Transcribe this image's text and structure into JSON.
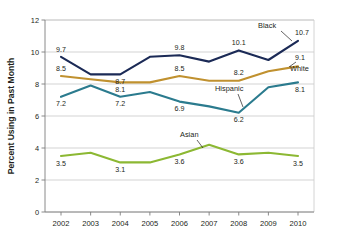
{
  "chart_data": {
    "type": "line",
    "title": "",
    "subtitle": "",
    "xlabel": "",
    "ylabel": "Percent Using in Past Month",
    "categories": [
      "2002",
      "2003",
      "2004",
      "2005",
      "2006",
      "2007",
      "2008",
      "2009",
      "2010"
    ],
    "x": [
      2002,
      2003,
      2004,
      2005,
      2006,
      2007,
      2008,
      2009,
      2010
    ],
    "ylim": [
      0,
      12
    ],
    "yticks": [
      0,
      2,
      4,
      6,
      8,
      10,
      12
    ],
    "grid": "horizontal",
    "legend_position": "inline-labels",
    "series": [
      {
        "name": "Black",
        "color": "#1b2a56",
        "values": [
          9.7,
          8.6,
          8.6,
          9.7,
          9.8,
          9.4,
          10.1,
          9.5,
          10.7
        ],
        "point_labels": [
          {
            "x": "2002",
            "value": "9.7"
          },
          {
            "x": "2004",
            "value": "8.7"
          },
          {
            "x": "2006",
            "value": "9.8"
          },
          {
            "x": "2008",
            "value": "10.1"
          },
          {
            "x": "2010",
            "value": "10.7"
          }
        ]
      },
      {
        "name": "White",
        "color": "#c0912f",
        "values": [
          8.5,
          8.3,
          8.1,
          8.1,
          8.5,
          8.2,
          8.2,
          8.8,
          9.1
        ],
        "point_labels": [
          {
            "x": "2002",
            "value": "8.5"
          },
          {
            "x": "2004",
            "value": "8.1"
          },
          {
            "x": "2006",
            "value": "8.5"
          },
          {
            "x": "2008",
            "value": "8.2"
          },
          {
            "x": "2010",
            "value": "9.1"
          }
        ]
      },
      {
        "name": "Hispanic",
        "color": "#2b7b8e",
        "values": [
          7.2,
          7.9,
          7.2,
          7.5,
          6.9,
          6.6,
          6.2,
          7.8,
          8.1
        ],
        "point_labels": [
          {
            "x": "2002",
            "value": "7.2"
          },
          {
            "x": "2004",
            "value": "7.2"
          },
          {
            "x": "2006",
            "value": "6.9"
          },
          {
            "x": "2008",
            "value": "6.2"
          },
          {
            "x": "2010",
            "value": "8.1"
          }
        ]
      },
      {
        "name": "Asian",
        "color": "#8cb833",
        "values": [
          3.5,
          3.7,
          3.1,
          3.1,
          3.6,
          4.2,
          3.6,
          3.7,
          3.5
        ],
        "point_labels": [
          {
            "x": "2002",
            "value": "3.5"
          },
          {
            "x": "2004",
            "value": "3.1"
          },
          {
            "x": "2006",
            "value": "3.6"
          },
          {
            "x": "2008",
            "value": "3.6"
          },
          {
            "x": "2010",
            "value": "3.5"
          }
        ]
      }
    ],
    "annotations": [
      {
        "label": "Black",
        "series": "Black"
      },
      {
        "label": "White",
        "series": "White"
      },
      {
        "label": "Hispanic",
        "series": "Hispanic"
      },
      {
        "label": "Asian",
        "series": "Asian"
      }
    ]
  },
  "axis": {
    "y_label": "Percent Using in Past Month",
    "y_ticks": [
      "12",
      "10",
      "8",
      "6",
      "4",
      "2",
      "0"
    ],
    "x_ticks": [
      "2002",
      "2003",
      "2004",
      "2005",
      "2006",
      "2007",
      "2008",
      "2009",
      "2010"
    ]
  },
  "labels": {
    "black": "Black",
    "white": "White",
    "hispanic": "Hispanic",
    "asian": "Asian",
    "black_pts": [
      "9.7",
      "8.7",
      "9.8",
      "10.1",
      "10.7"
    ],
    "white_pts": [
      "8.5",
      "8.1",
      "8.5",
      "8.2",
      "9.1"
    ],
    "hispanic_pts": [
      "7.2",
      "7.2",
      "6.9",
      "6.2",
      "8.1"
    ],
    "asian_pts": [
      "3.5",
      "3.1",
      "3.6",
      "3.6",
      "3.5"
    ]
  },
  "colors": {
    "black_series": "#1b2a56",
    "white_series": "#c0912f",
    "hispanic_series": "#2b7b8e",
    "asian_series": "#8cb833",
    "grid": "#c0c0c0",
    "axis": "#7d7d7d",
    "text": "#231f20"
  }
}
